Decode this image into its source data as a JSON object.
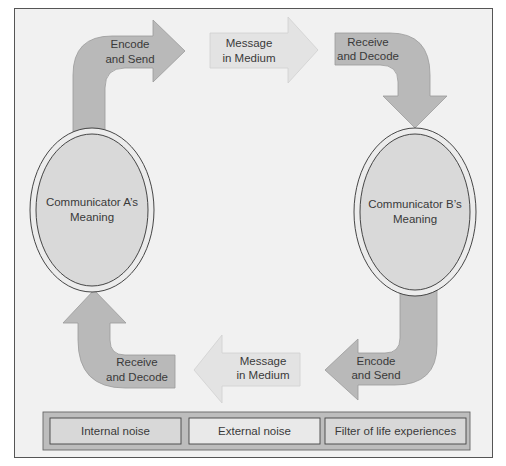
{
  "diagram": {
    "title": "",
    "communicators": [
      {
        "id": "A",
        "label_lines": [
          "Communicator A’s",
          "Meaning"
        ]
      },
      {
        "id": "B",
        "label_lines": [
          "Communicator B’s",
          "Meaning"
        ]
      }
    ],
    "arrows": [
      {
        "id": "a-encode-send",
        "from": "Communicator A",
        "direction": "up-then-right",
        "label_lines": [
          "Encode",
          "and Send"
        ]
      },
      {
        "id": "top-message",
        "direction": "right",
        "label_lines": [
          "Message",
          "in Medium"
        ]
      },
      {
        "id": "b-receive-decode",
        "to": "Communicator B",
        "direction": "right-then-down",
        "label_lines": [
          "Receive",
          "and Decode"
        ]
      },
      {
        "id": "b-encode-send",
        "from": "Communicator B",
        "direction": "down-then-left",
        "label_lines": [
          "Encode",
          "and Send"
        ]
      },
      {
        "id": "bottom-message",
        "direction": "left",
        "label_lines": [
          "Message",
          "in Medium"
        ]
      },
      {
        "id": "a-receive-decode",
        "to": "Communicator A",
        "direction": "left-then-up",
        "label_lines": [
          "Receive",
          "and Decode"
        ]
      }
    ],
    "noise_bar": {
      "items": [
        "Internal noise",
        "External noise",
        "Filter of life experiences"
      ]
    },
    "colors": {
      "background": "#f1f1f1",
      "frame": "#555555",
      "dark_arrow": "#b9b9b9",
      "light_arrow": "#e3e3e3",
      "ellipse_fill": "#d9d9d9",
      "ellipse_stroke": "#333333",
      "noise_bar_fill": "#bdbdbd",
      "noise_item_fill": "#d8d8d8",
      "noise_item_light": "#e9e9e9",
      "text": "#3a3a3a"
    }
  }
}
